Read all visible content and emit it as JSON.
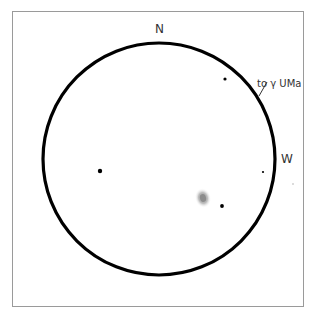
{
  "chart": {
    "type": "eyepiece-field-sketch",
    "directions": {
      "north": "N",
      "west": "W"
    },
    "pointer_label": "to γ UMa",
    "field_circle": {
      "cx": 159,
      "cy": 159,
      "r": 116,
      "stroke": "#000000"
    },
    "stars": [
      {
        "x": 225,
        "y": 79,
        "r": 1.6
      },
      {
        "x": 100,
        "y": 171,
        "r": 2.2
      },
      {
        "x": 263,
        "y": 172,
        "r": 1.1
      },
      {
        "x": 222,
        "y": 206,
        "r": 1.9
      }
    ],
    "galaxy": {
      "x": 203,
      "y": 198,
      "rx": 7,
      "ry": 9
    },
    "faint_mark": {
      "x": 293,
      "y": 184
    }
  }
}
